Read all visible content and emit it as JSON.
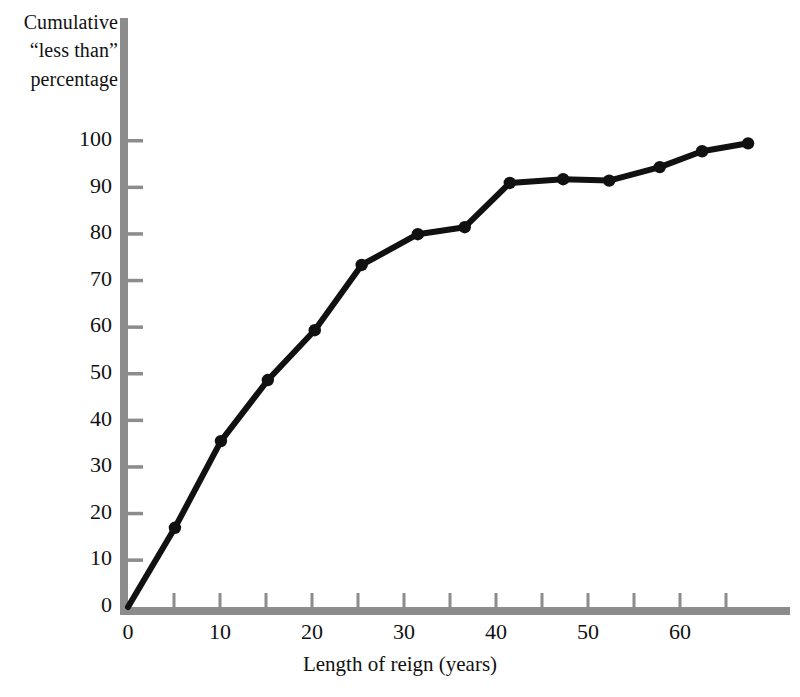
{
  "chart_data": {
    "type": "line",
    "title": "",
    "subtitle": "",
    "xlabel": "Length of reign (years)",
    "ylabel_lines": [
      "Cumulative",
      "“less than”",
      "percentage"
    ],
    "ylabel": "Cumulative “less than” percentage",
    "xlim": [
      0,
      67
    ],
    "ylim": [
      0,
      103
    ],
    "xticks": [
      0,
      10,
      20,
      30,
      40,
      50,
      60
    ],
    "xticklabels": [
      "0",
      "10",
      "20",
      "30",
      "40",
      "50",
      "60"
    ],
    "xminorticks": [
      5,
      15,
      25,
      35,
      45,
      55,
      65
    ],
    "yticks": [
      0,
      10,
      20,
      30,
      40,
      50,
      60,
      70,
      80,
      90,
      100
    ],
    "yticklabels": [
      "0",
      "10",
      "20",
      "30",
      "40",
      "50",
      "60",
      "70",
      "80",
      "90",
      "100"
    ],
    "grid": false,
    "legend": null,
    "series": [
      {
        "name": "Cumulative percentage of reigns",
        "marker": "filled-circle",
        "color": "#111111",
        "linewidth": 6,
        "x": [
          0,
          5.1,
          10.1,
          15.2,
          20.3,
          25.4,
          31.5,
          36.6,
          41.5,
          47.3,
          52.3,
          57.8,
          62.4,
          67.4
        ],
        "y": [
          0,
          17.0,
          35.6,
          48.7,
          59.4,
          73.4,
          80.0,
          81.5,
          91.0,
          91.8,
          91.5,
          94.4,
          97.8,
          99.5
        ],
        "points": [
          {
            "x": 0,
            "y": 0
          },
          {
            "x": 5.1,
            "y": 17.0
          },
          {
            "x": 10.1,
            "y": 35.6
          },
          {
            "x": 15.2,
            "y": 48.7
          },
          {
            "x": 20.3,
            "y": 59.4
          },
          {
            "x": 25.4,
            "y": 73.4
          },
          {
            "x": 31.5,
            "y": 80.0
          },
          {
            "x": 36.6,
            "y": 81.5
          },
          {
            "x": 41.5,
            "y": 91.0
          },
          {
            "x": 47.3,
            "y": 91.8
          },
          {
            "x": 52.3,
            "y": 91.5
          },
          {
            "x": 57.8,
            "y": 94.4
          },
          {
            "x": 62.4,
            "y": 97.8
          },
          {
            "x": 67.4,
            "y": 99.5
          }
        ]
      }
    ]
  },
  "style": {
    "axis_color": "#8c8c8c",
    "line_color": "#111111",
    "text_color": "#111111",
    "background": "#ffffff"
  }
}
